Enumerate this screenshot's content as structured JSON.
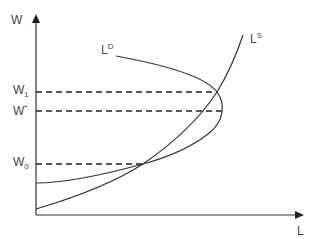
{
  "diagram": {
    "type": "labor-market supply and demand",
    "axes": {
      "y_label": "W",
      "x_label": "L"
    },
    "curves": {
      "demand": {
        "label_main": "L",
        "label_sup": "D"
      },
      "supply": {
        "label_main": "L",
        "label_sup": "S"
      }
    },
    "wage_levels": [
      {
        "main": "W",
        "sub": "1",
        "sup": ""
      },
      {
        "main": "W",
        "sub": "",
        "sup": "*"
      },
      {
        "main": "W",
        "sub": "0",
        "sup": ""
      }
    ],
    "colors": {
      "line": "#333333",
      "text": "#444444",
      "background": "#ffffff"
    }
  }
}
